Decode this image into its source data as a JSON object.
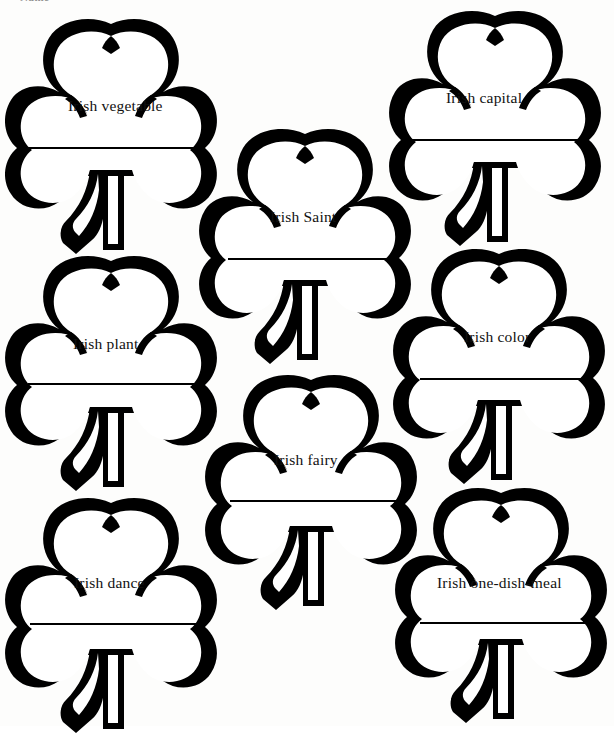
{
  "worksheet": {
    "top_clipped_text": "Name",
    "ink_color": "#000000",
    "paper_color": "#fdfdfc",
    "shamrocks": [
      {
        "id": "irish-vegetable",
        "label": "Irish vegetable",
        "x": 2,
        "y": 18,
        "w": 218,
        "h": 238,
        "label_left": 68,
        "label_top": 98,
        "line_left": 26,
        "line_top": 147,
        "line_width": 170
      },
      {
        "id": "irish-capital",
        "label": "Irish capital",
        "x": 386,
        "y": 10,
        "w": 218,
        "h": 238,
        "label_left": 446,
        "label_top": 90,
        "line_left": 408,
        "line_top": 139,
        "line_width": 170
      },
      {
        "id": "irish-saint",
        "label": "Irish Saint",
        "x": 196,
        "y": 128,
        "w": 218,
        "h": 238,
        "label_left": 270,
        "label_top": 209,
        "line_left": 228,
        "line_top": 258,
        "line_width": 170
      },
      {
        "id": "irish-plant",
        "label": "Irish plant",
        "x": 2,
        "y": 255,
        "w": 218,
        "h": 238,
        "label_left": 73,
        "label_top": 336,
        "line_left": 28,
        "line_top": 383,
        "line_width": 170
      },
      {
        "id": "irish-color",
        "label": "Irish color",
        "x": 390,
        "y": 248,
        "w": 218,
        "h": 238,
        "label_left": 464,
        "label_top": 329,
        "line_left": 420,
        "line_top": 378,
        "line_width": 170
      },
      {
        "id": "irish-fairy",
        "label": "Irish fairy",
        "x": 202,
        "y": 374,
        "w": 218,
        "h": 238,
        "label_left": 274,
        "label_top": 452,
        "line_left": 230,
        "line_top": 500,
        "line_width": 170
      },
      {
        "id": "irish-dance",
        "label": "Irish dance",
        "x": 2,
        "y": 497,
        "w": 218,
        "h": 238,
        "label_left": 74,
        "label_top": 575,
        "line_left": 30,
        "line_top": 623,
        "line_width": 170
      },
      {
        "id": "irish-one-dish-meal",
        "label": "Irish one-dish-meal",
        "x": 392,
        "y": 487,
        "w": 218,
        "h": 238,
        "label_left": 437,
        "label_top": 575,
        "line_left": 420,
        "line_top": 622,
        "line_width": 170
      }
    ]
  }
}
